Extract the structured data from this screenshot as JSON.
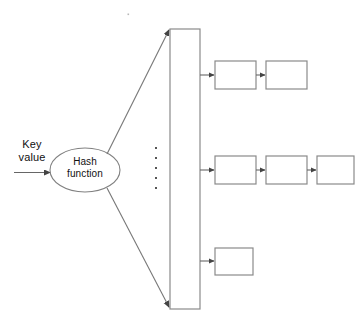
{
  "diagram": {
    "input": {
      "label": "Key\nvalue",
      "arrow_name": "key-value-arrow"
    },
    "hash_function": {
      "label": "Hash\nfunction"
    },
    "table": {
      "name": "hash-table-column",
      "label": ""
    },
    "ellipsis": {
      "dot_count": 5
    },
    "chains": [
      {
        "name": "chain-top",
        "nodes": [
          "",
          ""
        ]
      },
      {
        "name": "chain-middle",
        "nodes": [
          "",
          "",
          ""
        ]
      },
      {
        "name": "chain-bottom",
        "nodes": [
          ""
        ]
      }
    ],
    "colors": {
      "stroke": "#808080",
      "arrow": "#555555",
      "text": "#111111",
      "background": "#ffffff"
    }
  }
}
